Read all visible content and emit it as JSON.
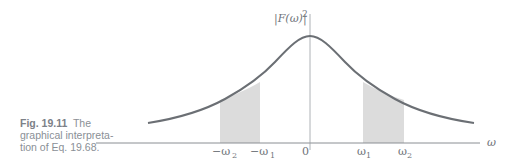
{
  "caption": {
    "fig_label": "Fig. 19.11",
    "line1_rest": "The",
    "line2": "graphical interpreta-",
    "line3": "tion of Eq. 19.68."
  },
  "figure": {
    "y_axis_label": "|F(ω)|",
    "y_axis_exponent": "2",
    "x_axis_label": "ω",
    "ticks": {
      "neg_omega2": "−ω",
      "neg_omega2_sub": "2",
      "neg_omega1": "−ω",
      "neg_omega1_sub": "1",
      "zero": "0",
      "omega1": "ω",
      "omega1_sub": "1",
      "omega2": "ω",
      "omega2_sub": "2"
    },
    "colors": {
      "curve": "#6b6f74",
      "axis": "#8a8e93",
      "shade": "#dcdcdc"
    }
  }
}
